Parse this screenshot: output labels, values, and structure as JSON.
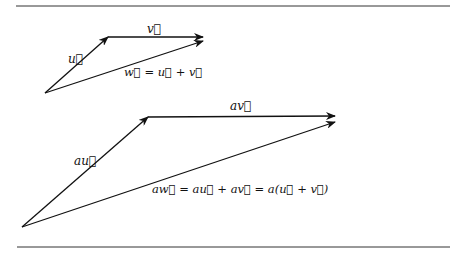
{
  "figure": {
    "rule_color": "#333333",
    "stroke_color": "#111111",
    "small_triangle": {
      "labels": {
        "u": "u⃗",
        "v": "v⃗",
        "w_eq": "w⃗ = u⃗ + v⃗"
      }
    },
    "large_triangle": {
      "labels": {
        "au": "au⃗",
        "av": "av⃗",
        "aw_eq": "aw⃗ = au⃗ +  av⃗ = a(u⃗ + v⃗)"
      }
    }
  }
}
